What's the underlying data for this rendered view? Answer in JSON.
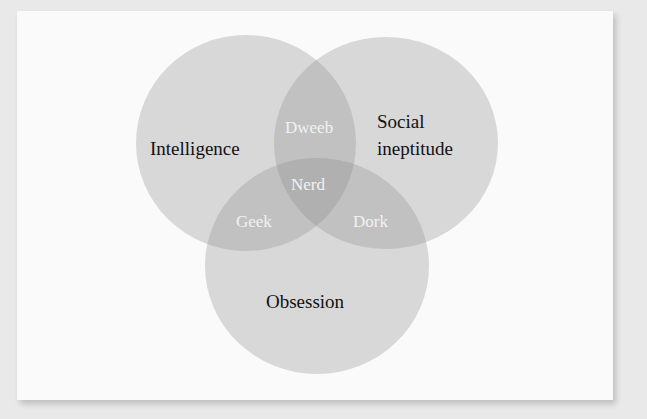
{
  "diagram": {
    "type": "venn",
    "sets": [
      {
        "id": "intelligence",
        "label": "Intelligence"
      },
      {
        "id": "social",
        "label_line1": "Social",
        "label_line2": "ineptitude"
      },
      {
        "id": "obsession",
        "label": "Obsession"
      }
    ],
    "intersections": [
      {
        "sets": [
          "intelligence",
          "social"
        ],
        "label": "Dweeb"
      },
      {
        "sets": [
          "intelligence",
          "obsession"
        ],
        "label": "Geek"
      },
      {
        "sets": [
          "social",
          "obsession"
        ],
        "label": "Dork"
      },
      {
        "sets": [
          "intelligence",
          "social",
          "obsession"
        ],
        "label": "Nerd"
      }
    ],
    "colors": {
      "background": "#e9e9e9",
      "card": "#fafafa",
      "circle_fill": "#8c8c8c",
      "circle_opacity": 0.3,
      "outer_label": "#111111",
      "inner_label": "#f2f2f2"
    }
  }
}
